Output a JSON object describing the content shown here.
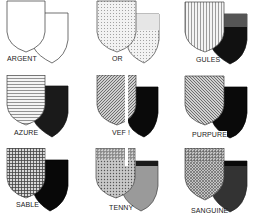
{
  "tinctures": [
    {
      "name": "ARGENT",
      "front_pattern": "plain-white",
      "back_fill": "#ffffff",
      "back_top": "#ffffff"
    },
    {
      "name": "OR",
      "front_pattern": "dots",
      "back_fill": "#d8d8d8",
      "back_top": "#e8e8e8"
    },
    {
      "name": "GULES",
      "front_pattern": "vertical-lines",
      "back_fill": "#111111",
      "back_top": "#555555"
    },
    {
      "name": "AZURE",
      "front_pattern": "horizontal-lines",
      "back_fill": "#1a1a1a",
      "back_top": "#1a1a1a"
    },
    {
      "name": "VERT",
      "front_pattern": "diagonal-lines",
      "back_fill": "#0a0a0a",
      "back_top": "#0a0a0a"
    },
    {
      "name": "PURPURE",
      "front_pattern": "diagonal-sinister",
      "back_fill": "#0a0a0a",
      "back_top": "#0a0a0a"
    },
    {
      "name": "SABLE",
      "front_pattern": "crosshatch",
      "back_fill": "#080808",
      "back_top": "#080808"
    },
    {
      "name": "TENNY",
      "front_pattern": "hatched-dots",
      "back_fill": "#9a9a9a",
      "back_top": "#1a1a1a"
    },
    {
      "name": "SANGUINE",
      "front_pattern": "diagonal-crosshatch",
      "back_fill": "#333333",
      "back_top": "#111111"
    }
  ],
  "labels_as_rendered": [
    "ARGENT",
    "OR",
    "GULES",
    "AZURE",
    "VEF !",
    "PURPURE",
    "SABLE",
    "TENNY",
    "SANGUINE"
  ]
}
